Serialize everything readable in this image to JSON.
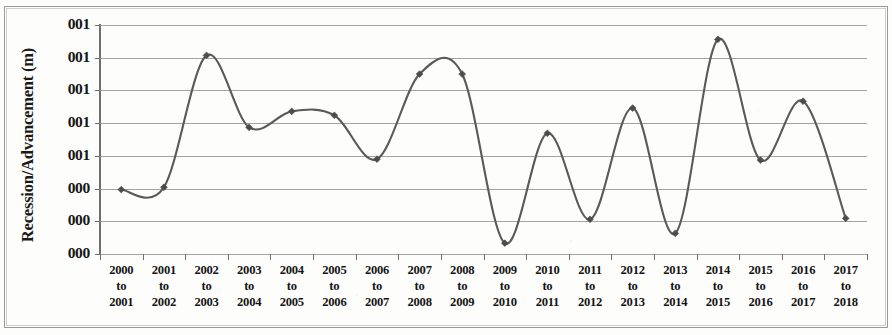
{
  "chart_data": {
    "type": "line",
    "title": "",
    "xlabel": "",
    "ylabel": "Recession/Advancement (m)",
    "grid": true,
    "legend": "none",
    "marker": "diamond",
    "line_color": "#595957",
    "marker_color": "#4c4c4a",
    "gridline_color": "#a3a3a1",
    "axis_color": "#6f6f6d",
    "categories": [
      "2000 to 2001",
      "2001 to 2002",
      "2002 to 2003",
      "2003 to 2004",
      "2004 to 2005",
      "2005 to 2006",
      "2006 to 2007",
      "2007 to 2008",
      "2008 to 2009",
      "2009 to 2010",
      "2010 to 2011",
      "2011 to 2012",
      "2012 to 2013",
      "2013 to 2014",
      "2014 to 2015",
      "2015 to 2016",
      "2016 to 2017",
      "2017 to 2018"
    ],
    "category_lines": [
      [
        "2000",
        "to",
        "2001"
      ],
      [
        "2001",
        "to",
        "2002"
      ],
      [
        "2002",
        "to",
        "2003"
      ],
      [
        "2003",
        "to",
        "2004"
      ],
      [
        "2004",
        "to",
        "2005"
      ],
      [
        "2005",
        "to",
        "2006"
      ],
      [
        "2006",
        "to",
        "2007"
      ],
      [
        "2007",
        "to",
        "2008"
      ],
      [
        "2008",
        "to",
        "2009"
      ],
      [
        "2009",
        "to",
        "2010"
      ],
      [
        "2010",
        "to",
        "2011"
      ],
      [
        "2011",
        "to",
        "2012"
      ],
      [
        "2012",
        "to",
        "2013"
      ],
      [
        "2013",
        "to",
        "2014"
      ],
      [
        "2014",
        "to",
        "2015"
      ],
      [
        "2015",
        "to",
        "2016"
      ],
      [
        "2016",
        "to",
        "2017"
      ],
      [
        "2017",
        "to",
        "2018"
      ]
    ],
    "values": [
      1.97,
      2.04,
      6.07,
      3.87,
      4.36,
      4.24,
      2.9,
      5.5,
      5.5,
      0.33,
      3.69,
      1.06,
      4.46,
      0.63,
      6.56,
      2.87,
      4.67,
      1.09
    ],
    "ylim": [
      0,
      7
    ],
    "ytick_positions": [
      7,
      6,
      5,
      4,
      3,
      2,
      1,
      0
    ],
    "ytick_labels": [
      "001",
      "001",
      "001",
      "001",
      "001",
      "000",
      "000",
      "000"
    ]
  },
  "axes": {
    "y_title": "Recession/Advancement (m)"
  }
}
